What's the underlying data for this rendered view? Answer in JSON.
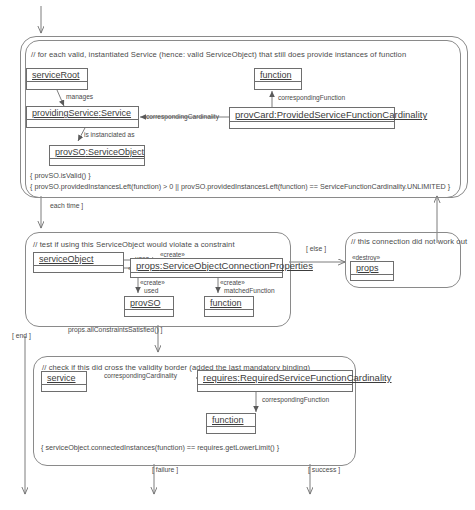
{
  "diagram": {
    "stroke_color": "#6e6e6e",
    "frame_color": "#8a8a8a",
    "text_color": "#4a4a4a",
    "background": "#ffffff"
  },
  "loop_frame": {
    "comment": "// for each valid, instantiated Service (hence: valid ServiceObject) that still does provide instances of function",
    "objects": {
      "service_root": {
        "name": "serviceRoot",
        "type": ""
      },
      "providing_service": {
        "name": "providingService",
        "type": ":Service"
      },
      "prov_so": {
        "name": "provSO",
        "type": ":ServiceObject"
      },
      "function": {
        "name": "function",
        "type": ""
      },
      "prov_card": {
        "name": "provCard",
        "type": ":ProvidedServiceFunctionCardinality"
      }
    },
    "edges": {
      "manages": "manages",
      "corresponding_cardinality": "correspondingCardinality",
      "is_instanciated_as": "is instanciated as",
      "corresponding_function": "correspondingFunction"
    },
    "constraints": [
      "{ provSO.isValid() }",
      "{ provSO.providedInstancesLeft(function) > 0 || provSO.providedInstancesLeft(function) == ServiceFunctionCardinality.UNLIMITED }"
    ]
  },
  "flow": {
    "each_time_guard": "each time ]",
    "else_guard": "[ else ]",
    "end_guard": "[ end ]",
    "all_constraints_guard": "props.allConstraintsSatisfied() ]",
    "failure_guard": "[ failure ]",
    "success_guard": "[ success ]"
  },
  "test_frame": {
    "comment": "// test if using this ServiceObject would violate a constraint",
    "objects": {
      "service_object": {
        "name": "serviceObject",
        "type": ""
      },
      "props": {
        "name": "props",
        "type": ":ServiceObjectConnectionProperties"
      },
      "prov_so": {
        "name": "provSO",
        "type": ""
      },
      "function": {
        "name": "function",
        "type": ""
      }
    },
    "edges": {
      "uses": "uses",
      "create_left": "«create»",
      "create_top": "«create»",
      "create_used": "«create»",
      "used": "used",
      "create_matched": "«create»",
      "matched_function": "matchedFunction"
    }
  },
  "else_frame": {
    "comment": "// this connection did not work out",
    "stereotype": "«destroy»",
    "objects": {
      "props": {
        "name": "props",
        "type": ""
      }
    }
  },
  "check_frame": {
    "comment": "// check if this did cross the validity border (added the last mandatory binding)",
    "objects": {
      "service": {
        "name": "service",
        "type": ""
      },
      "requires": {
        "name": "requires",
        "type": ":RequiredServiceFunctionCardinality"
      },
      "function": {
        "name": "function",
        "type": ""
      }
    },
    "edges": {
      "corresponding_cardinality": "correspondingCardinality",
      "corresponding_function": "correspondingFunction"
    },
    "constraints": [
      "{ serviceObject.connectedInstances(function) == requires.getLowerLimit() }"
    ]
  }
}
